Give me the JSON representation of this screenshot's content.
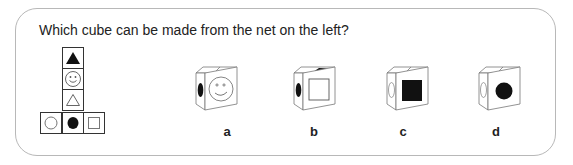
{
  "question": "Which cube can be made from the net on the left?",
  "net": {
    "cells": [
      {
        "position": "column-1",
        "symbol": "black-triangle"
      },
      {
        "position": "column-2",
        "symbol": "smiley-face"
      },
      {
        "position": "column-3",
        "symbol": "outline-triangle"
      },
      {
        "position": "bottom-left",
        "symbol": "outline-circle"
      },
      {
        "position": "bottom-center",
        "symbol": "black-circle"
      },
      {
        "position": "bottom-right",
        "symbol": "outline-square"
      }
    ]
  },
  "options": [
    {
      "label": "a",
      "top": "outline-triangle (edge)",
      "left": "black-circle",
      "front": "smiley-face"
    },
    {
      "label": "b",
      "top": "black-triangle",
      "left": "black-circle",
      "front": "outline-square"
    },
    {
      "label": "c",
      "top": "outline-triangle (edge)",
      "left": "outline-circle",
      "front": "black-square"
    },
    {
      "label": "d",
      "top": "outline-triangle (edge)",
      "left": "outline-circle",
      "front": "black-circle"
    }
  ],
  "colors": {
    "border": "#b8b8b8",
    "ink": "#222222"
  }
}
